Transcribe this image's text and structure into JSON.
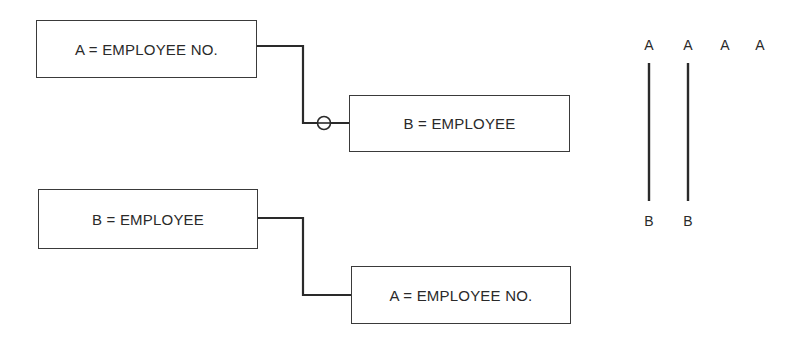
{
  "diagram": {
    "top_relation": {
      "source": {
        "label": "A = EMPLOYEE NO."
      },
      "target": {
        "label": "B = EMPLOYEE"
      },
      "connector": "optional (circle)"
    },
    "bottom_relation": {
      "source": {
        "label": "B = EMPLOYEE"
      },
      "target": {
        "label": "A = EMPLOYEE NO."
      },
      "connector": "plain"
    },
    "mapping": {
      "top_letters": [
        "A",
        "A",
        "A",
        "A"
      ],
      "bottom_letters": [
        "B",
        "B"
      ]
    }
  }
}
